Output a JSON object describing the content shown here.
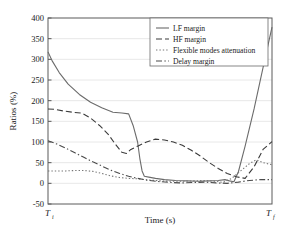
{
  "chart_data": {
    "type": "line",
    "title": "",
    "xlabel": "Time (s)",
    "ylabel": "Ratios (%)",
    "ylim": [
      -50,
      400
    ],
    "xlim": [
      0,
      100
    ],
    "yticks": [
      400,
      350,
      300,
      250,
      200,
      150,
      100,
      50,
      0,
      -50
    ],
    "ytick_labels": [
      "400",
      "350",
      "300",
      "250",
      "200",
      "150",
      "100",
      "50",
      "0",
      "-50"
    ],
    "xtick_labels": [
      "Ti",
      "Tf"
    ],
    "xtick_display": [
      {
        "base": "T",
        "sub": "i"
      },
      {
        "base": "T",
        "sub": "f"
      }
    ],
    "grid": true,
    "grid_axis": "y",
    "legend_position": "top-right",
    "series": [
      {
        "name": "LF margin",
        "style": "solid",
        "color": "#6b6b6b",
        "x": [
          0,
          2,
          5,
          9,
          14,
          19,
          24,
          29,
          33,
          36,
          38,
          40,
          41,
          42,
          43,
          45,
          48,
          52,
          57,
          62,
          67,
          72,
          76,
          79,
          81,
          83,
          85,
          88,
          92,
          96,
          100
        ],
        "y": [
          318,
          295,
          268,
          240,
          215,
          196,
          183,
          172,
          170,
          168,
          140,
          100,
          60,
          30,
          17,
          15,
          12,
          9,
          7,
          6,
          5,
          6,
          7,
          9,
          6,
          4,
          28,
          90,
          180,
          280,
          378
        ]
      },
      {
        "name": "HF margin",
        "style": "dashed",
        "color": "#3a3a3a",
        "x": [
          0,
          3,
          7,
          11,
          15,
          19,
          23,
          27,
          30,
          33,
          35,
          37,
          40,
          44,
          48,
          52,
          56,
          60,
          64,
          68,
          72,
          76,
          80,
          84,
          88,
          92,
          96,
          100
        ],
        "y": [
          180,
          179,
          175,
          172,
          170,
          158,
          140,
          118,
          95,
          75,
          72,
          82,
          90,
          100,
          107,
          105,
          100,
          92,
          80,
          66,
          50,
          36,
          24,
          16,
          12,
          40,
          82,
          101
        ]
      },
      {
        "name": "Flexible modes attenuation",
        "style": "dotted",
        "color": "#777777",
        "x": [
          0,
          4,
          8,
          12,
          16,
          20,
          24,
          28,
          32,
          36,
          40,
          45,
          50,
          55,
          60,
          65,
          70,
          75,
          78,
          82,
          86,
          90,
          93,
          96,
          100
        ],
        "y": [
          30,
          30,
          30,
          31,
          31,
          29,
          24,
          18,
          14,
          12,
          11,
          8,
          6,
          5,
          5,
          6,
          7,
          5,
          2,
          12,
          30,
          48,
          57,
          50,
          45
        ]
      },
      {
        "name": "Delay margin",
        "style": "dashdot",
        "color": "#4a4a4a",
        "x": [
          0,
          4,
          8,
          12,
          16,
          20,
          24,
          28,
          32,
          36,
          40,
          45,
          50,
          55,
          60,
          65,
          70,
          75,
          80,
          85,
          90,
          95,
          100
        ],
        "y": [
          103,
          95,
          85,
          74,
          63,
          52,
          42,
          32,
          24,
          17,
          12,
          7,
          4,
          2,
          1,
          2,
          3,
          1,
          0,
          3,
          7,
          9,
          9
        ]
      }
    ]
  },
  "legend": {
    "entries": [
      {
        "label": "LF margin",
        "style": "solid"
      },
      {
        "label": "HF margin",
        "style": "dashed"
      },
      {
        "label": "Flexible modes attenuation",
        "style": "dotted"
      },
      {
        "label": "Delay margin",
        "style": "dashdot"
      }
    ]
  },
  "colors": {
    "axis": "#4a4a4a",
    "grid": "#e2e2e2",
    "background": "#ffffff",
    "text": "#1a1a1a"
  }
}
